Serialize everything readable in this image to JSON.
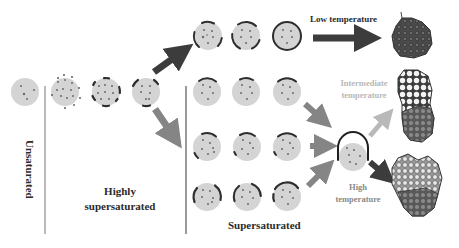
{
  "colors": {
    "particle_fill": "#d4d4d4",
    "dot": "#6a6a6a",
    "shell": "#2e2e2e",
    "arrow_dark": "#3c3c3c",
    "arrow_mid": "#858585",
    "arrow_light": "#b9b9b9",
    "divider": "#8c8c8c",
    "text_dark": "#2a2a2a",
    "text_light": "#b8b8b8",
    "text_mid": "#8a8a8a"
  },
  "regions": {
    "unsaturated": {
      "label": "Unsaturated"
    },
    "highly_supersaturated": {
      "label_line1": "Highly",
      "label_line2": "supersaturated"
    },
    "supersaturated": {
      "label": "Supersaturated"
    }
  },
  "temperatures": {
    "low": {
      "label": "Low temperature"
    },
    "intermediate": {
      "label_line1": "Intermediate",
      "label_line2": "temperature"
    },
    "high": {
      "label_line1": "High",
      "label_line2": "temperature"
    }
  },
  "products": {
    "low": {
      "name": "dense-aggregate"
    },
    "intermediate": {
      "name": "porous-top-dense-bottom-aggregate"
    },
    "high": {
      "name": "bubbly-shell-aggregate"
    }
  },
  "stages": {
    "unsaturated_particle": {
      "shell": "none"
    },
    "nucleation_particle": {
      "shell": "scattered-nuclei"
    },
    "growth_particle": {
      "shell": "small-patches"
    },
    "split_particle": {
      "shell": "larger-patches"
    },
    "low_temp_row": {
      "count": 3,
      "shell": "increasing-coverage-to-full-ring"
    },
    "row_2": {
      "count": 3,
      "shell": "top-cap"
    },
    "row_3": {
      "count": 3,
      "shell": "top-cap-and-side-patch"
    },
    "row_4": {
      "count": 3,
      "shell": "two-side-caps"
    },
    "merged_particle": {
      "shell": "dome-arch"
    }
  }
}
